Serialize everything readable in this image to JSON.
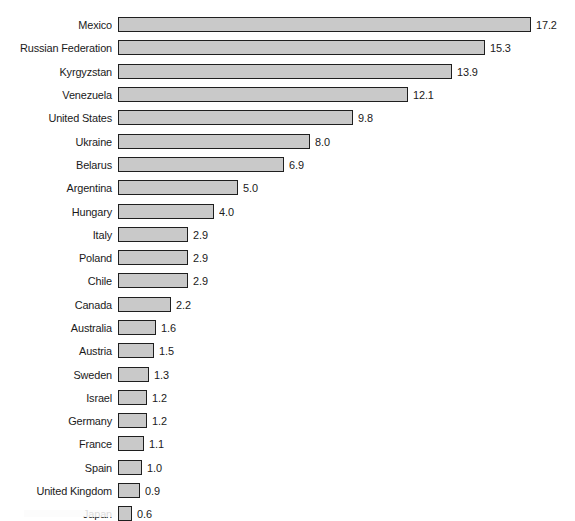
{
  "chart_data": {
    "type": "bar",
    "orientation": "horizontal",
    "title": "",
    "subtitle": "",
    "xlabel": "",
    "ylabel": "",
    "xlim": [
      0,
      17.2
    ],
    "grid": false,
    "legend": null,
    "value_label_format": "one-decimal",
    "bar_fill_color": "#c9c9c9",
    "bar_border_color": "#1f1f1f",
    "text_color": "#1a1a1a",
    "background_color": "#ffffff",
    "px_per_unit": 24.0,
    "categories": [
      "Mexico",
      "Russian Federation",
      "Kyrgyzstan",
      "Venezuela",
      "United States",
      "Ukraine",
      "Belarus",
      "Argentina",
      "Hungary",
      "Italy",
      "Poland",
      "Chile",
      "Canada",
      "Australia",
      "Austria",
      "Sweden",
      "Israel",
      "Germany",
      "France",
      "Spain",
      "United Kingdom",
      "Japan"
    ],
    "values": [
      17.2,
      15.3,
      13.9,
      12.1,
      9.8,
      8.0,
      6.9,
      5.0,
      4.0,
      2.9,
      2.9,
      2.9,
      2.2,
      1.6,
      1.5,
      1.3,
      1.2,
      1.2,
      1.1,
      1.0,
      0.9,
      0.6
    ],
    "value_labels": [
      "17.2",
      "15.3",
      "13.9",
      "12.1",
      "9.8",
      "8.0",
      "6.9",
      "5.0",
      "4.0",
      "2.9",
      "2.9",
      "2.9",
      "2.2",
      "1.6",
      "1.5",
      "1.3",
      "1.2",
      "1.2",
      "1.1",
      "1.0",
      "0.9",
      "0.6"
    ]
  }
}
